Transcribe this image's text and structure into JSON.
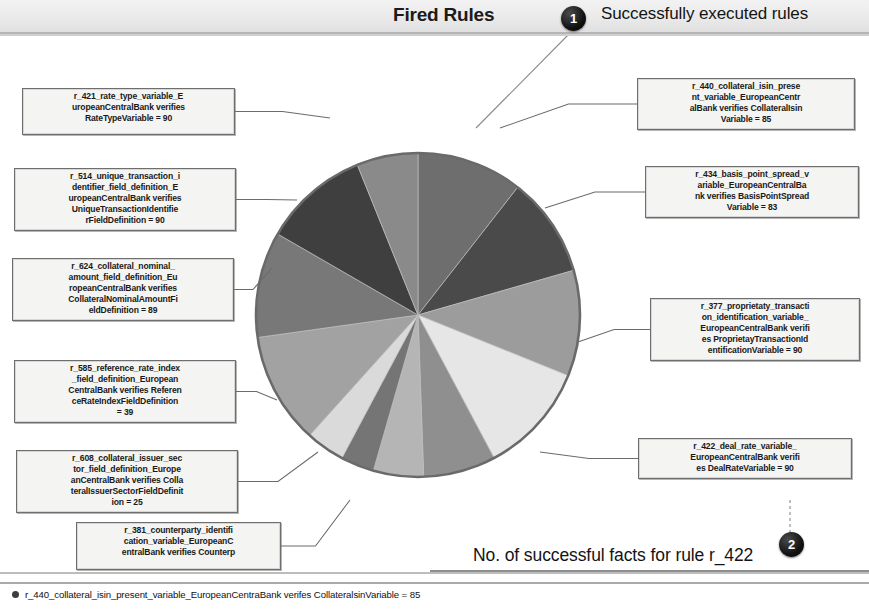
{
  "header": {
    "title": "Fired Rules",
    "callout_1_label": "1",
    "callout_1_text": "Successfully executed rules",
    "callout_2_label": "2",
    "callout_2_text": "No. of successful facts for rule r_422"
  },
  "legend": {
    "swatch_color": "#3d3d3d",
    "text": "r_440_collateral_isin_present_variable_EuropeanCentraBank verifes CollateralsinVariable = 85"
  },
  "labels": [
    {
      "id": "r_421",
      "lines": [
        "r_421_rate_type_variable_E",
        "uropeanCentralBank verifies",
        "RateTypeVariable = 90"
      ],
      "value": 90
    },
    {
      "id": "r_514",
      "lines": [
        "r_514_unique_transaction_i",
        "dentifier_field_definition_E",
        "uropeanCentralBank verifies",
        "UniqueTransactionIdentifie",
        "rFieldDefinition = 90"
      ],
      "value": 90
    },
    {
      "id": "r_624",
      "lines": [
        "r_624_collateral_nominal_",
        "amount_field_definition_Eu",
        "ropeanCentralBank verifies",
        "CollateralNominalAmountFi",
        "eldDefinition = 89"
      ],
      "value": 89
    },
    {
      "id": "r_585",
      "lines": [
        "r_585_reference_rate_index",
        "_field_definition_European",
        "CentralBank verifies Referen",
        "ceRateIndexFieldDefinition",
        "= 39"
      ],
      "value": 39
    },
    {
      "id": "r_608",
      "lines": [
        "r_608_collateral_issuer_sec",
        "tor_field_definition_Europe",
        "anCentralBank verifies Colla",
        "teralIssuerSectorFieldDefinit",
        "ion = 25"
      ],
      "value": 25
    },
    {
      "id": "r_381",
      "lines": [
        "r_381_counterparty_identifi",
        "cation_variable_EuropeanC",
        "entralBank verifies Counterp"
      ],
      "value": null
    },
    {
      "id": "r_440",
      "lines": [
        "r_440_collateral_isin_prese",
        "nt_variable_EuropeanCentr",
        "alBank verifies CollateralIsin",
        "Variable = 85"
      ],
      "value": 85
    },
    {
      "id": "r_434",
      "lines": [
        "r_434_basis_point_spread_v",
        "ariable_EuropeanCentralBa",
        "nk verifies BasisPointSpread",
        "Variable = 83"
      ],
      "value": 83
    },
    {
      "id": "r_377",
      "lines": [
        "r_377_proprietaty_transacti",
        "on_identification_variable_",
        "EuropeanCentralBank verifi",
        "es ProprietayTransactionId",
        "entificationVariable = 90"
      ],
      "value": 90
    },
    {
      "id": "r_422",
      "lines": [
        "r_422_deal_rate_variable_",
        "EuropeanCentralBank verifi",
        "es DealRateVariable = 90"
      ],
      "value": 90
    }
  ],
  "chart_data": {
    "type": "pie",
    "title": "Fired Rules",
    "legend_position": "bottom",
    "value_label": "No. of successful facts",
    "center": {
      "x": 418,
      "y": 315
    },
    "radius": 162,
    "categories": [
      "r_440_collateral_isin_present_variable_EuropeanCentralBank verifies CollateralIsinVariable",
      "r_434_basis_point_spread_variable_EuropeanCentralBank verifies BasisPointSpreadVariable",
      "r_377_proprietaty_transaction_identification_variable_EuropeanCentralBank verifies ProprietayTransactionIdentificationVariable",
      "r_422_deal_rate_variable_EuropeanCentralBank verifies DealRateVariable",
      "r_381_counterparty_identification_variable_EuropeanCentralBank verifies Counterp",
      "r_608_collateral_issuer_sector_field_definition_EuropeanCentralBank verifies CollateralIssuerSectorFieldDefinition",
      "r_585_reference_rate_index_field_definition_EuropeanCentralBank verifies ReferenceRateIndexFieldDefinition",
      "r_624_collateral_nominal_amount_field_definition_EuropeanCentralBank verifies CollateralNominalAmountFieldDefinition",
      "r_514_unique_transaction_identifier_field_definition_EuropeanCentralBank verifies UniqueTransactionIdentifierFieldDefinition",
      "r_421_rate_type_variable_EuropeanCentralBank verifies RateTypeVariable"
    ],
    "values": [
      85,
      83,
      90,
      90,
      25,
      25,
      39,
      89,
      90,
      90
    ],
    "slices": [
      {
        "id": "r_440",
        "value": 85,
        "start_deg": 0,
        "end_deg": 38,
        "color": "#6e6e6e"
      },
      {
        "id": "r_434",
        "value": 83,
        "start_deg": 38,
        "end_deg": 74,
        "color": "#4a4a4a"
      },
      {
        "id": "r_377",
        "value": 90,
        "start_deg": 74,
        "end_deg": 112,
        "color": "#9c9c9c"
      },
      {
        "id": "r_422",
        "value": 90,
        "start_deg": 112,
        "end_deg": 152,
        "color": "#e6e6e6"
      },
      {
        "id": "r_381",
        "value": 60,
        "start_deg": 152,
        "end_deg": 178,
        "color": "#8f8f8f"
      },
      {
        "id": "r_608",
        "value": 25,
        "start_deg": 178,
        "end_deg": 196,
        "color": "#b5b5b5"
      },
      {
        "id": "r_585",
        "value": 39,
        "start_deg": 196,
        "end_deg": 208,
        "color": "#757575"
      },
      {
        "id": "extra",
        "value": 30,
        "start_deg": 208,
        "end_deg": 222,
        "color": "#dadada"
      },
      {
        "id": "r_624",
        "value": 89,
        "start_deg": 222,
        "end_deg": 262,
        "color": "#a2a2a2"
      },
      {
        "id": "r_514",
        "value": 90,
        "start_deg": 262,
        "end_deg": 300,
        "color": "#787878"
      },
      {
        "id": "r_421",
        "value": 90,
        "start_deg": 300,
        "end_deg": 338,
        "color": "#3f3f3f"
      },
      {
        "id": "top",
        "value": 60,
        "start_deg": 338,
        "end_deg": 360,
        "color": "#8a8a8a"
      }
    ]
  }
}
